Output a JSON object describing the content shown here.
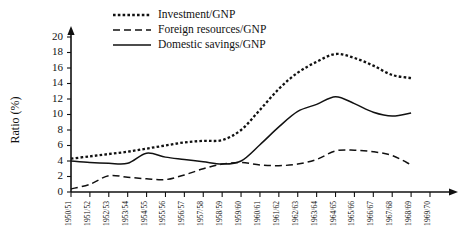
{
  "chart_data": {
    "type": "line",
    "title": "",
    "xlabel": "",
    "ylabel": "Ratio (%)",
    "ylim": [
      0,
      20
    ],
    "ytick_step": 2,
    "grid": false,
    "legend_position": "top-center",
    "yticks": [
      "0",
      "2",
      "4",
      "6",
      "8",
      "10",
      "12",
      "14",
      "16",
      "18",
      "20"
    ],
    "categories": [
      "1950/51",
      "1951/52",
      "1952/53",
      "1953/54",
      "1954/55",
      "1955/56",
      "1956/57",
      "1957/58",
      "1958/59",
      "1959/60",
      "1960/61",
      "1961/62",
      "1962/63",
      "1963/64",
      "1964/65",
      "1965/66",
      "1966/67",
      "1967/68",
      "1968/69",
      "1969/70"
    ],
    "series": [
      {
        "name": "Investment/GNP",
        "style": "dotted",
        "values": [
          4.3,
          4.6,
          4.9,
          5.2,
          5.6,
          6.0,
          6.4,
          6.6,
          6.7,
          8.0,
          10.6,
          13.3,
          15.4,
          16.8,
          17.8,
          17.3,
          16.3,
          15.1,
          14.7,
          null
        ]
      },
      {
        "name": "Foreign resources/GNP",
        "style": "dashed",
        "values": [
          0.4,
          1.0,
          2.1,
          1.9,
          1.7,
          1.6,
          2.2,
          3.0,
          3.6,
          3.8,
          3.5,
          3.4,
          3.6,
          4.2,
          5.3,
          5.4,
          5.2,
          4.7,
          3.5,
          null
        ]
      },
      {
        "name": "Domestic savings/GNP",
        "style": "solid",
        "values": [
          4.0,
          3.8,
          3.7,
          3.7,
          5.0,
          4.5,
          4.2,
          3.9,
          3.6,
          4.0,
          6.1,
          8.4,
          10.4,
          11.3,
          12.3,
          11.4,
          10.3,
          9.8,
          10.2,
          null
        ]
      }
    ],
    "legend": [
      {
        "label": "Investment/GNP",
        "style": "dotted"
      },
      {
        "label": "Foreign resources/GNP",
        "style": "dashed"
      },
      {
        "label": "Domestic savings/GNP",
        "style": "solid"
      }
    ]
  }
}
